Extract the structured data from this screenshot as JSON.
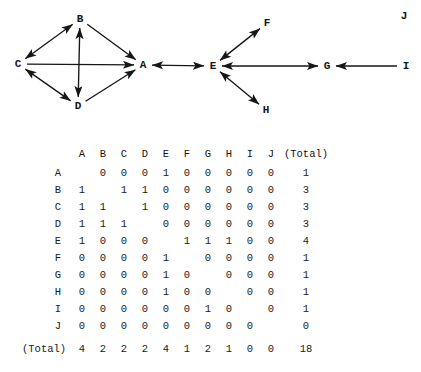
{
  "graph": {
    "nodes": [
      {
        "id": "A",
        "label": "A",
        "x": 143,
        "y": 65
      },
      {
        "id": "B",
        "label": "B",
        "x": 80,
        "y": 19
      },
      {
        "id": "C",
        "label": "C",
        "x": 18,
        "y": 64
      },
      {
        "id": "D",
        "label": "D",
        "x": 78,
        "y": 106
      },
      {
        "id": "E",
        "label": "E",
        "x": 213,
        "y": 66
      },
      {
        "id": "F",
        "label": "F",
        "x": 267,
        "y": 23
      },
      {
        "id": "G",
        "label": "G",
        "x": 327,
        "y": 66
      },
      {
        "id": "H",
        "label": "H",
        "x": 266,
        "y": 110
      },
      {
        "id": "I",
        "label": "I",
        "x": 406,
        "y": 66
      },
      {
        "id": "J",
        "label": "J",
        "x": 404,
        "y": 16
      }
    ],
    "edges": [
      {
        "from": "B",
        "to": "C",
        "arrows": "both"
      },
      {
        "from": "B",
        "to": "D",
        "arrows": "both"
      },
      {
        "from": "C",
        "to": "D",
        "arrows": "both"
      },
      {
        "from": "B",
        "to": "A",
        "arrows": "to"
      },
      {
        "from": "C",
        "to": "A",
        "arrows": "to"
      },
      {
        "from": "D",
        "to": "A",
        "arrows": "to"
      },
      {
        "from": "A",
        "to": "E",
        "arrows": "both"
      },
      {
        "from": "E",
        "to": "F",
        "arrows": "both"
      },
      {
        "from": "E",
        "to": "H",
        "arrows": "both"
      },
      {
        "from": "E",
        "to": "G",
        "arrows": "both"
      },
      {
        "from": "I",
        "to": "G",
        "arrows": "to"
      }
    ],
    "isolated_nodes": [
      "J"
    ]
  },
  "matrix": {
    "corner_label": "",
    "total_header": "(Total)",
    "total_row_label": "(Total)",
    "column_headers": [
      "A",
      "B",
      "C",
      "D",
      "E",
      "F",
      "G",
      "H",
      "I",
      "J"
    ],
    "row_labels": [
      "A",
      "B",
      "C",
      "D",
      "E",
      "F",
      "G",
      "H",
      "I",
      "J"
    ],
    "rows": [
      {
        "label": "A",
        "cells": [
          "",
          "0",
          "0",
          "0",
          "1",
          "0",
          "0",
          "0",
          "0",
          "0"
        ],
        "total": "1"
      },
      {
        "label": "B",
        "cells": [
          "1",
          "",
          "1",
          "1",
          "0",
          "0",
          "0",
          "0",
          "0",
          "0"
        ],
        "total": "3"
      },
      {
        "label": "C",
        "cells": [
          "1",
          "1",
          "",
          "1",
          "0",
          "0",
          "0",
          "0",
          "0",
          "0"
        ],
        "total": "3"
      },
      {
        "label": "D",
        "cells": [
          "1",
          "1",
          "1",
          "",
          "0",
          "0",
          "0",
          "0",
          "0",
          "0"
        ],
        "total": "3"
      },
      {
        "label": "E",
        "cells": [
          "1",
          "0",
          "0",
          "0",
          "",
          "1",
          "1",
          "1",
          "0",
          "0"
        ],
        "total": "4"
      },
      {
        "label": "F",
        "cells": [
          "0",
          "0",
          "0",
          "0",
          "1",
          "",
          "0",
          "0",
          "0",
          "0"
        ],
        "total": "1"
      },
      {
        "label": "G",
        "cells": [
          "0",
          "0",
          "0",
          "0",
          "1",
          "0",
          "",
          "0",
          "0",
          "0"
        ],
        "total": "1"
      },
      {
        "label": "H",
        "cells": [
          "0",
          "0",
          "0",
          "0",
          "1",
          "0",
          "0",
          "",
          "0",
          "0"
        ],
        "total": "1"
      },
      {
        "label": "I",
        "cells": [
          "0",
          "0",
          "0",
          "0",
          "0",
          "0",
          "1",
          "0",
          "",
          "0"
        ],
        "total": "1"
      },
      {
        "label": "J",
        "cells": [
          "0",
          "0",
          "0",
          "0",
          "0",
          "0",
          "0",
          "0",
          "0",
          ""
        ],
        "total": "0"
      }
    ],
    "column_totals": [
      "4",
      "2",
      "2",
      "2",
      "4",
      "1",
      "2",
      "1",
      "0",
      "0"
    ],
    "grand_total": "18"
  },
  "layout": {
    "column_x": [
      82,
      103,
      124,
      145,
      166,
      187,
      208,
      229,
      250,
      271
    ],
    "total_x": 306,
    "row_label_x": 58,
    "header_y": 14,
    "first_row_y": 33,
    "row_step": 17,
    "total_row_y": 209
  },
  "colors": {
    "ink": "#1a1a1a",
    "background": "#ffffff"
  }
}
